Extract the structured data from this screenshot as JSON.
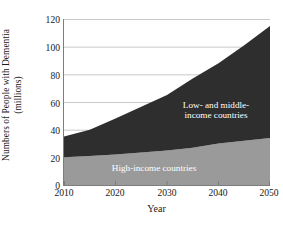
{
  "chart_data": {
    "type": "area",
    "stacked": true,
    "title": "",
    "subtitle": "",
    "xlabel": "Year",
    "ylabel": "Numbers of People with Dementia (millions)",
    "ylabel_lines": [
      "Numbers of People with Dementia",
      "(millions)"
    ],
    "x": [
      2010,
      2015,
      2020,
      2025,
      2030,
      2035,
      2040,
      2045,
      2050
    ],
    "xlim": [
      2010,
      2050
    ],
    "ylim": [
      0,
      120
    ],
    "xticks": [
      2010,
      2020,
      2030,
      2040,
      2050
    ],
    "yticks": [
      0,
      20,
      40,
      60,
      80,
      100,
      120
    ],
    "grid": "horizontal",
    "legend_position": "in-plot-annotations",
    "series": [
      {
        "name": "High-income countries",
        "color": "#9a9a9a",
        "values": [
          20,
          21,
          22,
          23.5,
          25,
          27,
          30,
          32,
          34
        ]
      },
      {
        "name": "Low- and middle-income countries",
        "color": "#2e2e2e",
        "values": [
          15,
          19,
          26,
          33,
          40,
          50,
          58,
          69,
          81
        ]
      }
    ],
    "totals": [
      35,
      40,
      48,
      56.5,
      65,
      77,
      88,
      101,
      115
    ],
    "annotations": [
      {
        "name": "low-and-middle-income-label",
        "text": "Low- and middle-income countries",
        "lines": [
          "Low- and middle-",
          "income countries"
        ],
        "color": "#ffffff"
      },
      {
        "name": "high-income-label",
        "text": "High-income countries",
        "lines": [
          "High-income countries"
        ],
        "color": "#ffffff"
      }
    ]
  },
  "axes": {
    "y_tick_labels": [
      "0",
      "20",
      "40",
      "60",
      "80",
      "100",
      "120"
    ],
    "x_tick_labels": [
      "2010",
      "2020",
      "2030",
      "2040",
      "2050"
    ],
    "x_title": "Year",
    "y_title_line1": "Numbers of People with Dementia",
    "y_title_line2": "(millions)"
  },
  "annotations": {
    "low_line1": "Low- and middle-",
    "low_line2": "income countries",
    "high": "High-income countries"
  },
  "colors": {
    "low_middle_income": "#2e2e2e",
    "high_income": "#9a9a9a",
    "gridline": "#c9c9c9",
    "axis": "#7d7d7d",
    "text": "#1a1a1a",
    "label_text": "#ffffff",
    "background": "#ffffff"
  }
}
